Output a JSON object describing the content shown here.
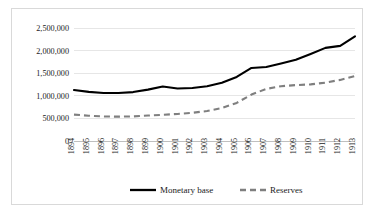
{
  "chart_data": {
    "type": "line",
    "title": "",
    "xlabel": "",
    "ylabel": "",
    "x": [
      1894,
      1895,
      1896,
      1897,
      1898,
      1899,
      1900,
      1901,
      1902,
      1903,
      1904,
      1905,
      1906,
      1907,
      1908,
      1909,
      1910,
      1911,
      1912,
      1913
    ],
    "categories": [
      "1894",
      "1895",
      "1896",
      "1897",
      "1898",
      "1899",
      "1900",
      "1901",
      "1902",
      "1903",
      "1904",
      "1905",
      "1906",
      "1907",
      "1908",
      "1909",
      "1910",
      "1911",
      "1912",
      "1913"
    ],
    "series": [
      {
        "name": "Monetary base",
        "style": "solid",
        "color": "#000000",
        "values": [
          1130000,
          1090000,
          1065000,
          1065000,
          1085000,
          1140000,
          1210000,
          1165000,
          1175000,
          1215000,
          1290000,
          1420000,
          1620000,
          1640000,
          1720000,
          1800000,
          1930000,
          2065000,
          2110000,
          2320000
        ]
      },
      {
        "name": "Reserves",
        "style": "dashed",
        "color": "#7f7f7f",
        "values": [
          585000,
          560000,
          545000,
          540000,
          545000,
          565000,
          580000,
          600000,
          625000,
          665000,
          730000,
          845000,
          1030000,
          1155000,
          1215000,
          1240000,
          1255000,
          1295000,
          1355000,
          1440000
        ]
      }
    ],
    "ylim": [
      0,
      2750000
    ],
    "yticks": [
      0,
      500000,
      1000000,
      1500000,
      2000000,
      2500000
    ],
    "ytick_labels": [
      "0",
      "500,000",
      "1,000,000",
      "1,500,000",
      "2,000,000",
      "2,500,000"
    ],
    "grid": true,
    "legend_position": "bottom"
  }
}
